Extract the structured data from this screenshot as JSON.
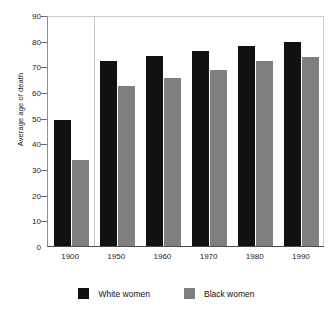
{
  "chart_data": {
    "type": "bar",
    "title": "",
    "subtitle": "",
    "xlabel": "",
    "ylabel": "Average age of death",
    "categories": [
      "1900",
      "1950",
      "1960",
      "1970",
      "1980",
      "1990"
    ],
    "series": [
      {
        "name": "White women",
        "color": "#111111",
        "values": [
          49,
          72,
          74,
          76,
          78,
          79.5
        ]
      },
      {
        "name": "Black women",
        "color": "#7f7f7f",
        "values": [
          33.5,
          62.5,
          65.5,
          68.5,
          72,
          73.5
        ]
      }
    ],
    "ylim": [
      0,
      90
    ],
    "ytick_values": [
      0,
      10,
      20,
      30,
      40,
      50,
      60,
      70,
      80,
      90
    ],
    "ytick_labels": [
      "0",
      "10",
      "20",
      "30",
      "40",
      "50",
      "60",
      "70",
      "80",
      "90"
    ],
    "grid": false,
    "legend_position": "bottom",
    "annotations": [
      "vertical divider between 1900 and 1950 groups"
    ]
  },
  "legend": {
    "entries": [
      {
        "label": "White women",
        "swatch_name": "legend-swatch-white-women"
      },
      {
        "label": "Black women",
        "swatch_name": "legend-swatch-black-women"
      }
    ]
  },
  "colors": {
    "white_women": "#111111",
    "black_women": "#7f7f7f",
    "axis": "#4a4a4a",
    "background": "#ffffff"
  }
}
